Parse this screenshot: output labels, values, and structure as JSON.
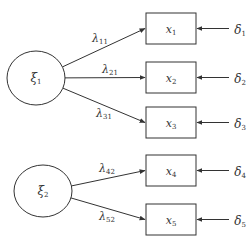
{
  "diagram": {
    "type": "structural-equation-model",
    "stroke_color": "#333333",
    "background": "#ffffff",
    "latent_factors": [
      {
        "id": "xi1",
        "symbol": "ξ",
        "subscript": "1",
        "cx": 36,
        "cy": 78,
        "rx": 29,
        "ry": 27
      },
      {
        "id": "xi2",
        "symbol": "ξ",
        "subscript": "2",
        "cx": 43,
        "cy": 191,
        "rx": 29,
        "ry": 26
      }
    ],
    "indicators": [
      {
        "id": "x1",
        "symbol": "x",
        "subscript": "1",
        "x": 146,
        "y": 13,
        "w": 50,
        "h": 31
      },
      {
        "id": "x2",
        "symbol": "x",
        "subscript": "2",
        "x": 146,
        "y": 62,
        "w": 50,
        "h": 31
      },
      {
        "id": "x3",
        "symbol": "x",
        "subscript": "3",
        "x": 146,
        "y": 107,
        "w": 50,
        "h": 31
      },
      {
        "id": "x4",
        "symbol": "x",
        "subscript": "4",
        "x": 146,
        "y": 155,
        "w": 50,
        "h": 31
      },
      {
        "id": "x5",
        "symbol": "x",
        "subscript": "5",
        "x": 146,
        "y": 204,
        "w": 50,
        "h": 31
      }
    ],
    "loadings": [
      {
        "from": "xi1",
        "to": "x1",
        "symbol": "λ",
        "subscript": "11",
        "label_x": 100,
        "label_y": 42
      },
      {
        "from": "xi1",
        "to": "x2",
        "symbol": "λ",
        "subscript": "21",
        "label_x": 110,
        "label_y": 73
      },
      {
        "from": "xi1",
        "to": "x3",
        "symbol": "λ",
        "subscript": "31",
        "label_x": 104,
        "label_y": 117
      },
      {
        "from": "xi2",
        "to": "x4",
        "symbol": "λ",
        "subscript": "42",
        "label_x": 107,
        "label_y": 172
      },
      {
        "from": "xi2",
        "to": "x5",
        "symbol": "λ",
        "subscript": "52",
        "label_x": 107,
        "label_y": 220
      }
    ],
    "errors": [
      {
        "to": "x1",
        "symbol": "δ",
        "subscript": "1"
      },
      {
        "to": "x2",
        "symbol": "δ",
        "subscript": "2"
      },
      {
        "to": "x3",
        "symbol": "δ",
        "subscript": "3"
      },
      {
        "to": "x4",
        "symbol": "δ",
        "subscript": "4"
      },
      {
        "to": "x5",
        "symbol": "δ",
        "subscript": "5"
      }
    ]
  }
}
